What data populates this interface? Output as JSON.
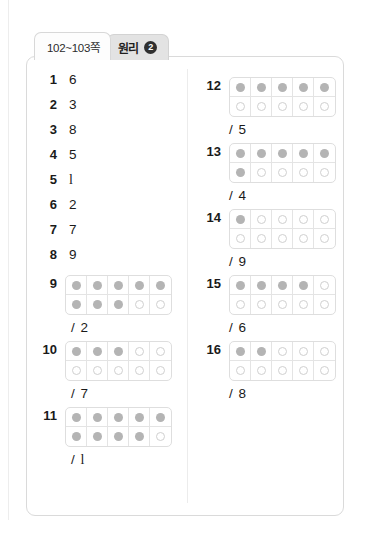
{
  "tabs": [
    {
      "label": "102~103쪽",
      "active": true
    },
    {
      "label": "원리",
      "badge": "2",
      "active": false
    }
  ],
  "answer_key": {
    "left_column": {
      "simple_items": [
        {
          "number": "1",
          "answer": "6"
        },
        {
          "number": "2",
          "answer": "3"
        },
        {
          "number": "3",
          "answer": "8"
        },
        {
          "number": "4",
          "answer": "5"
        },
        {
          "number": "5",
          "answer": "1"
        },
        {
          "number": "6",
          "answer": "2"
        },
        {
          "number": "7",
          "answer": "7"
        },
        {
          "number": "8",
          "answer": "9"
        }
      ],
      "frame_items": [
        {
          "number": "9",
          "fraction": "/ 2",
          "filled_count": 8,
          "top_row": [
            "filled",
            "filled",
            "filled",
            "filled",
            "filled"
          ],
          "bottom_row": [
            "filled",
            "filled",
            "filled",
            "empty",
            "empty"
          ]
        },
        {
          "number": "10",
          "fraction": "/ 7",
          "filled_count": 3,
          "top_row": [
            "filled",
            "filled",
            "filled",
            "empty",
            "empty"
          ],
          "bottom_row": [
            "empty",
            "empty",
            "empty",
            "empty",
            "empty"
          ]
        },
        {
          "number": "11",
          "fraction": "/ 1",
          "filled_count": 9,
          "top_row": [
            "filled",
            "filled",
            "filled",
            "filled",
            "filled"
          ],
          "bottom_row": [
            "filled",
            "filled",
            "filled",
            "filled",
            "empty"
          ]
        }
      ]
    },
    "right_column": {
      "frame_items": [
        {
          "number": "12",
          "fraction": "/ 5",
          "filled_count": 5,
          "top_row": [
            "filled",
            "filled",
            "filled",
            "filled",
            "filled"
          ],
          "bottom_row": [
            "empty",
            "empty",
            "empty",
            "empty",
            "empty"
          ]
        },
        {
          "number": "13",
          "fraction": "/ 4",
          "filled_count": 6,
          "top_row": [
            "filled",
            "filled",
            "filled",
            "filled",
            "filled"
          ],
          "bottom_row": [
            "filled",
            "empty",
            "empty",
            "empty",
            "empty"
          ]
        },
        {
          "number": "14",
          "fraction": "/ 9",
          "filled_count": 1,
          "top_row": [
            "filled",
            "empty",
            "empty",
            "empty",
            "empty"
          ],
          "bottom_row": [
            "empty",
            "empty",
            "empty",
            "empty",
            "empty"
          ]
        },
        {
          "number": "15",
          "fraction": "/ 6",
          "filled_count": 4,
          "top_row": [
            "filled",
            "filled",
            "filled",
            "filled",
            "empty"
          ],
          "bottom_row": [
            "empty",
            "empty",
            "empty",
            "empty",
            "empty"
          ]
        },
        {
          "number": "16",
          "fraction": "/ 8",
          "filled_count": 2,
          "top_row": [
            "filled",
            "filled",
            "empty",
            "empty",
            "empty"
          ],
          "bottom_row": [
            "empty",
            "empty",
            "empty",
            "empty",
            "empty"
          ]
        }
      ]
    }
  }
}
